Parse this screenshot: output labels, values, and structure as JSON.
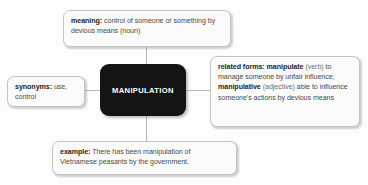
{
  "diagram": {
    "type": "word-map",
    "center": {
      "label": "MANIPULATION",
      "fill": "#141414",
      "text_color": "#ffffff"
    },
    "nodes": {
      "meaning": {
        "label": "meaning:",
        "body": " control of someone or something by devious means (noun)"
      },
      "related_forms": {
        "label": "related forms:",
        "term_one": " manipulate",
        "pos_one": " (verb)",
        "body_one": " to manage someone by unfair influence;",
        "term_two": " manipulative",
        "pos_two": " (adjective)",
        "body_two": " able to influence someone's actions by devious means"
      },
      "synonyms": {
        "label": "synonyms:",
        "body": " use, control"
      },
      "example": {
        "label": "example:",
        "body": " There has been manipulation of Vietnamese peasants by the government."
      }
    },
    "colors": {
      "box_fill": "#fbfbfb",
      "box_border": "#c4c4c4",
      "connector": "#b9b9b9",
      "body_text": "#4a4a4a",
      "label_text": "#1d1d1d",
      "muted_text": "#707070"
    }
  }
}
